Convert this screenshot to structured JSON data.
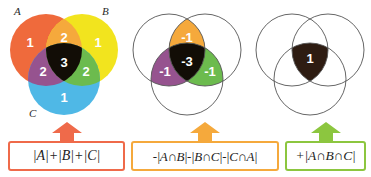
{
  "figure": {
    "set_labels": {
      "a": "A",
      "b": "B",
      "c": "C"
    }
  },
  "colors": {
    "a_only": "#ef6a3c",
    "b_only": "#f2e41e",
    "c_only": "#4fb8e6",
    "ab": "#f5a93c",
    "ac": "#96538f",
    "bc": "#6cbb4e",
    "abc": "#120d06",
    "circle_outline": "#555555",
    "box1_border": "#ef6a4a",
    "box2_border": "#f5a93c",
    "box3_border": "#8cc63f",
    "arrow1": "#ef6a4a",
    "arrow2": "#f5a93c",
    "arrow3": "#8cc63f",
    "number_text": "#ffffff"
  },
  "panels": [
    {
      "id": "panel-1",
      "caption": "Sum of individual set sizes",
      "regions": [
        {
          "name": "a-only",
          "label": "1",
          "color": "#ef6a3c"
        },
        {
          "name": "b-only",
          "label": "1",
          "color": "#f2e41e"
        },
        {
          "name": "c-only",
          "label": "1",
          "color": "#4fb8e6"
        },
        {
          "name": "a-and-b",
          "label": "2",
          "color": "#f5a93c"
        },
        {
          "name": "a-and-c",
          "label": "2",
          "color": "#96538f"
        },
        {
          "name": "b-and-c",
          "label": "2",
          "color": "#6cbb4e"
        },
        {
          "name": "a-and-b-and-c",
          "label": "3",
          "color": "#120d06"
        }
      ]
    },
    {
      "id": "panel-2",
      "caption": "Subtract pairwise intersections",
      "regions": [
        {
          "name": "a-only",
          "label": "",
          "color": "none"
        },
        {
          "name": "b-only",
          "label": "",
          "color": "none"
        },
        {
          "name": "c-only",
          "label": "",
          "color": "none"
        },
        {
          "name": "a-and-b",
          "label": "-1",
          "color": "#f5a93c"
        },
        {
          "name": "a-and-c",
          "label": "-1",
          "color": "#96538f"
        },
        {
          "name": "b-and-c",
          "label": "-1",
          "color": "#6cbb4e"
        },
        {
          "name": "a-and-b-and-c",
          "label": "-3",
          "color": "#120d06"
        }
      ]
    },
    {
      "id": "panel-3",
      "caption": "Add back the triple intersection",
      "regions": [
        {
          "name": "a-only",
          "label": "",
          "color": "none"
        },
        {
          "name": "b-only",
          "label": "",
          "color": "none"
        },
        {
          "name": "c-only",
          "label": "",
          "color": "none"
        },
        {
          "name": "a-and-b",
          "label": "",
          "color": "none"
        },
        {
          "name": "a-and-c",
          "label": "",
          "color": "none"
        },
        {
          "name": "b-and-c",
          "label": "",
          "color": "none"
        },
        {
          "name": "a-and-b-and-c",
          "label": "1",
          "color": "#2e1c12"
        }
      ]
    }
  ],
  "formulas": [
    {
      "id": "formula-1",
      "text": "|A|+|B|+|C|",
      "border": "#ef6a4a",
      "arrow": "#ef6a4a"
    },
    {
      "id": "formula-2",
      "text": "-|A∩B|-|B∩C|-|C∩A|",
      "border": "#f5a93c",
      "arrow": "#f5a93c"
    },
    {
      "id": "formula-3",
      "text": "+|A∩B∩C|",
      "border": "#8cc63f",
      "arrow": "#8cc63f"
    }
  ]
}
